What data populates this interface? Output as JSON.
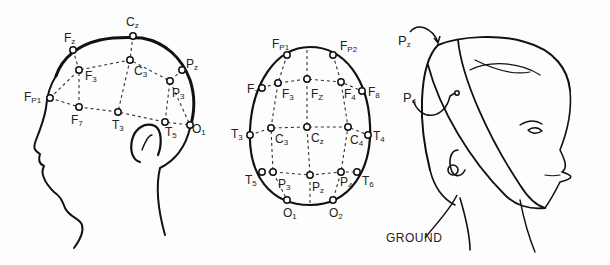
{
  "figure": {
    "panels": [
      {
        "name": "side-view",
        "electrodes": [
          {
            "id": "Fz",
            "main": "F",
            "sub": "z",
            "x": 73,
            "y": 50,
            "lx": 64,
            "ly": 32
          },
          {
            "id": "Cz",
            "main": "C",
            "sub": "z",
            "x": 133,
            "y": 36,
            "lx": 126,
            "ly": 16
          },
          {
            "id": "Pz",
            "main": "P",
            "sub": "z",
            "x": 182,
            "y": 70,
            "lx": 186,
            "ly": 58
          },
          {
            "id": "F3",
            "main": "F",
            "sub": "3",
            "x": 79,
            "y": 70,
            "lx": 85,
            "ly": 70
          },
          {
            "id": "C3",
            "main": "C",
            "sub": "3",
            "x": 130,
            "y": 60,
            "lx": 134,
            "ly": 65
          },
          {
            "id": "P3",
            "main": "P",
            "sub": "3",
            "x": 170,
            "y": 81,
            "lx": 172,
            "ly": 87
          },
          {
            "id": "Fp1",
            "main": "F",
            "sub": "P1",
            "x": 50,
            "y": 98,
            "lx": 24,
            "ly": 91
          },
          {
            "id": "F7",
            "main": "F",
            "sub": "7",
            "x": 79,
            "y": 107,
            "lx": 71,
            "ly": 114
          },
          {
            "id": "T3",
            "main": "T",
            "sub": "3",
            "x": 118,
            "y": 112,
            "lx": 112,
            "ly": 119
          },
          {
            "id": "T5",
            "main": "T",
            "sub": "5",
            "x": 165,
            "y": 122,
            "lx": 165,
            "ly": 126
          },
          {
            "id": "O1",
            "main": "O",
            "sub": "1",
            "x": 190,
            "y": 125,
            "lx": 192,
            "ly": 123
          }
        ]
      },
      {
        "name": "top-view",
        "electrodes": [
          {
            "id": "Fp1",
            "main": "F",
            "sub": "P1",
            "x": 287,
            "y": 55,
            "lx": 272,
            "ly": 38
          },
          {
            "id": "Fp2",
            "main": "F",
            "sub": "P2",
            "x": 333,
            "y": 55,
            "lx": 340,
            "ly": 40
          },
          {
            "id": "F7",
            "main": "F",
            "sub": "7",
            "x": 262,
            "y": 88,
            "lx": 247,
            "ly": 83
          },
          {
            "id": "F3",
            "main": "F",
            "sub": "3",
            "x": 278,
            "y": 83,
            "lx": 282,
            "ly": 88
          },
          {
            "id": "Fz",
            "main": "F",
            "sub": "Z",
            "x": 307,
            "y": 79,
            "lx": 311,
            "ly": 88
          },
          {
            "id": "F4",
            "main": "F",
            "sub": "4",
            "x": 341,
            "y": 82,
            "lx": 344,
            "ly": 88
          },
          {
            "id": "F8",
            "main": "F",
            "sub": "8",
            "x": 362,
            "y": 91,
            "lx": 368,
            "ly": 86
          },
          {
            "id": "T3",
            "main": "T",
            "sub": "3",
            "x": 250,
            "y": 135,
            "lx": 231,
            "ly": 128
          },
          {
            "id": "C3",
            "main": "C",
            "sub": "3",
            "x": 271,
            "y": 128,
            "lx": 275,
            "ly": 133
          },
          {
            "id": "Cz",
            "main": "C",
            "sub": "z",
            "x": 307,
            "y": 127,
            "lx": 311,
            "ly": 132
          },
          {
            "id": "C4",
            "main": "C",
            "sub": "4",
            "x": 348,
            "y": 127,
            "lx": 350,
            "ly": 134
          },
          {
            "id": "T4",
            "main": "T",
            "sub": "4",
            "x": 368,
            "y": 135,
            "lx": 373,
            "ly": 130
          },
          {
            "id": "T5",
            "main": "T",
            "sub": "5",
            "x": 262,
            "y": 172,
            "lx": 245,
            "ly": 174
          },
          {
            "id": "P3",
            "main": "P",
            "sub": "3",
            "x": 273,
            "y": 172,
            "lx": 278,
            "ly": 178
          },
          {
            "id": "Pz",
            "main": "P",
            "sub": "z",
            "x": 310,
            "y": 175,
            "lx": 312,
            "ly": 181
          },
          {
            "id": "P4",
            "main": "P",
            "sub": "4",
            "x": 341,
            "y": 172,
            "lx": 340,
            "ly": 176
          },
          {
            "id": "T6",
            "main": "T",
            "sub": "6",
            "x": 357,
            "y": 172,
            "lx": 362,
            "ly": 175
          },
          {
            "id": "O1",
            "main": "O",
            "sub": "1",
            "x": 287,
            "y": 200,
            "lx": 283,
            "ly": 207
          },
          {
            "id": "O2",
            "main": "O",
            "sub": "2",
            "x": 333,
            "y": 200,
            "lx": 329,
            "ly": 207
          }
        ]
      },
      {
        "name": "headband-view",
        "labels": [
          {
            "id": "Pz",
            "main": "P",
            "sub": "z",
            "lx": 398,
            "ly": 40
          },
          {
            "id": "P4",
            "main": "P",
            "sub": "4",
            "lx": 403,
            "ly": 91
          }
        ],
        "ground_label": "GROUND"
      }
    ]
  }
}
